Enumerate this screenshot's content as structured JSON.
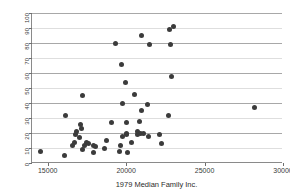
{
  "chart_data": {
    "type": "scatter",
    "title": "",
    "xlabel": "1979 Median Family Inc.",
    "ylabel": "% homes cost $100K+",
    "xlim": [
      14000,
      30000
    ],
    "ylim": [
      0,
      100
    ],
    "xticks": [
      15000,
      20000,
      25000,
      30000
    ],
    "xticklabels": [
      "15000",
      "20000",
      "25000",
      "30000"
    ],
    "yticks": [
      0,
      10,
      20,
      30,
      40,
      50,
      60,
      70,
      80,
      90,
      100
    ],
    "yticklabels": [
      "0",
      "10",
      "20",
      "30",
      "40",
      "50",
      "60",
      "70",
      "80",
      "90",
      "100"
    ],
    "grid": "horizontal",
    "legend": "none",
    "marker": {
      "shape": "circle",
      "color": "#3b3b3b",
      "size": 5
    },
    "points": [
      {
        "x": 14550,
        "y": 8
      },
      {
        "x": 16100,
        "y": 5
      },
      {
        "x": 16150,
        "y": 32
      },
      {
        "x": 16600,
        "y": 12
      },
      {
        "x": 16700,
        "y": 14
      },
      {
        "x": 16800,
        "y": 19
      },
      {
        "x": 16850,
        "y": 21
      },
      {
        "x": 17000,
        "y": 17
      },
      {
        "x": 17100,
        "y": 26
      },
      {
        "x": 17150,
        "y": 23
      },
      {
        "x": 17200,
        "y": 9
      },
      {
        "x": 17250,
        "y": 45
      },
      {
        "x": 17350,
        "y": 12
      },
      {
        "x": 17450,
        "y": 14
      },
      {
        "x": 17600,
        "y": 13
      },
      {
        "x": 17900,
        "y": 7
      },
      {
        "x": 17950,
        "y": 12
      },
      {
        "x": 18050,
        "y": 11
      },
      {
        "x": 18600,
        "y": 10
      },
      {
        "x": 18750,
        "y": 15
      },
      {
        "x": 19050,
        "y": 27
      },
      {
        "x": 19350,
        "y": 80
      },
      {
        "x": 19600,
        "y": 8
      },
      {
        "x": 19650,
        "y": 12
      },
      {
        "x": 19700,
        "y": 66
      },
      {
        "x": 19750,
        "y": 18
      },
      {
        "x": 19800,
        "y": 40
      },
      {
        "x": 19950,
        "y": 54
      },
      {
        "x": 20000,
        "y": 27
      },
      {
        "x": 20000,
        "y": 20
      },
      {
        "x": 20050,
        "y": 19
      },
      {
        "x": 20100,
        "y": 7
      },
      {
        "x": 20350,
        "y": 14
      },
      {
        "x": 20550,
        "y": 46
      },
      {
        "x": 20700,
        "y": 19
      },
      {
        "x": 20750,
        "y": 21
      },
      {
        "x": 20850,
        "y": 28
      },
      {
        "x": 20900,
        "y": 20
      },
      {
        "x": 20950,
        "y": 85
      },
      {
        "x": 21000,
        "y": 35
      },
      {
        "x": 21100,
        "y": 20
      },
      {
        "x": 21350,
        "y": 39
      },
      {
        "x": 21400,
        "y": 18
      },
      {
        "x": 21500,
        "y": 79
      },
      {
        "x": 22100,
        "y": 19
      },
      {
        "x": 22250,
        "y": 13
      },
      {
        "x": 22700,
        "y": 32
      },
      {
        "x": 22750,
        "y": 89
      },
      {
        "x": 22800,
        "y": 79
      },
      {
        "x": 22900,
        "y": 58
      },
      {
        "x": 23050,
        "y": 91
      },
      {
        "x": 28200,
        "y": 37
      }
    ]
  },
  "figure": {
    "background_color": "#ffffff",
    "marker_color": "#3b3b3b",
    "grid_color": "#c9c9c9",
    "axis_color": "#8a8a8a"
  }
}
